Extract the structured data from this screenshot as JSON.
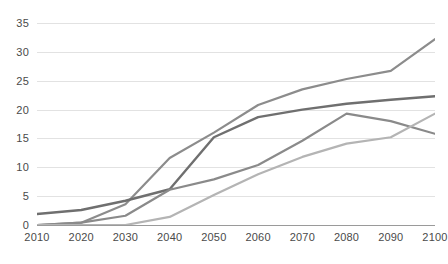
{
  "chart_data": {
    "type": "line",
    "title": "",
    "subtitle": "",
    "xlabel": "",
    "ylabel": "",
    "x": [
      2010,
      2020,
      2030,
      2040,
      2050,
      2060,
      2070,
      2080,
      2090,
      2100
    ],
    "categories": [
      "2010",
      "2020",
      "2030",
      "2040",
      "2050",
      "2060",
      "2070",
      "2080",
      "2090",
      "2100"
    ],
    "xlim": [
      2010,
      2100
    ],
    "ylim": [
      0,
      35
    ],
    "y_ticks": [
      0,
      5,
      10,
      15,
      20,
      25,
      30,
      35
    ],
    "y_tick_labels": [
      "0",
      "5",
      "10",
      "15",
      "20",
      "25",
      "30",
      "35"
    ],
    "grid": "horizontal",
    "legend": "none",
    "background": "#ffffff",
    "gridline_color": "#e2e2e2",
    "axis_color": "#9a9a9a",
    "tick_label_color": "#4a4a4a",
    "series": [
      {
        "name": "series-1",
        "color": "#8c8c8c",
        "width": 2.2,
        "values": [
          0,
          0.4,
          3.6,
          11.6,
          16.0,
          20.8,
          23.5,
          25.3,
          26.7,
          32.2
        ]
      },
      {
        "name": "series-2",
        "color": "#6f6f6f",
        "width": 2.4,
        "values": [
          1.9,
          2.6,
          4.2,
          6.2,
          15.2,
          18.7,
          20.0,
          21.0,
          21.7,
          22.3
        ]
      },
      {
        "name": "series-3",
        "color": "#8a8a8a",
        "width": 2.2,
        "values": [
          0,
          0.4,
          1.6,
          6.1,
          7.9,
          10.4,
          14.6,
          19.3,
          18.0,
          15.8
        ]
      },
      {
        "name": "series-4",
        "color": "#b4b4b4",
        "width": 2.2,
        "values": [
          0,
          0,
          0,
          1.4,
          5.2,
          8.8,
          11.8,
          14.1,
          15.2,
          19.3
        ]
      }
    ]
  }
}
